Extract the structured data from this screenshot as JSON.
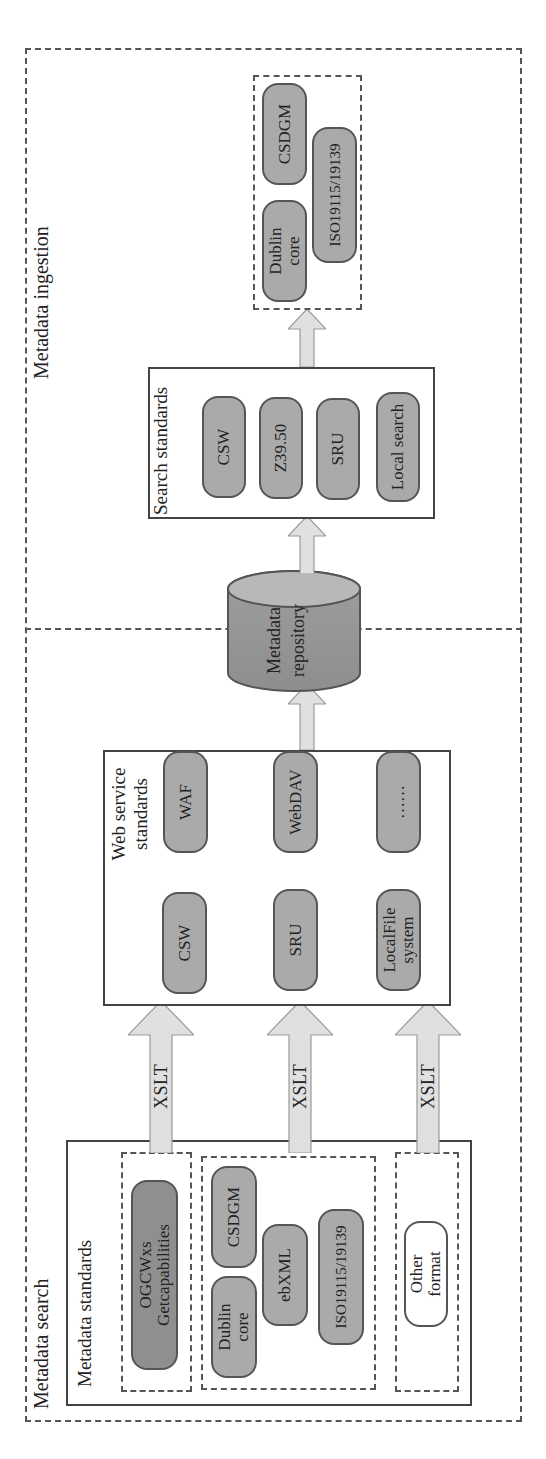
{
  "sections": {
    "ingestion_label": "Metadata ingestion",
    "search_label": "Metadata search"
  },
  "metadata_standards": {
    "title": "Metadata standards",
    "group1": [
      {
        "label": "OGCWxs Getcapabilities"
      }
    ],
    "group2": [
      {
        "label": "Dublin core"
      },
      {
        "label": "CSDGM"
      },
      {
        "label": "ebXML"
      },
      {
        "label": "ISO19115/19139"
      }
    ],
    "group3": [
      {
        "label": "Other format"
      }
    ]
  },
  "arrows": {
    "xslt1": "XSLT",
    "xslt2": "XSLT",
    "xslt3": "XSLT"
  },
  "web_service_standards": {
    "title": "Web service standards",
    "items": [
      {
        "label": "CSW"
      },
      {
        "label": "WAF"
      },
      {
        "label": "SRU"
      },
      {
        "label": "WebDAV"
      },
      {
        "label": "LocalFile system"
      },
      {
        "label": "……"
      }
    ]
  },
  "repository": {
    "label": "Metadata repository"
  },
  "search_standards": {
    "title": "Search standards",
    "items": [
      {
        "label": "CSW"
      },
      {
        "label": "Z39.50"
      },
      {
        "label": "SRU"
      },
      {
        "label": "Local search"
      }
    ]
  },
  "output_formats": {
    "items": [
      {
        "label": "Dublin core"
      },
      {
        "label": "CSDGM"
      },
      {
        "label": "ISO19115/19139"
      }
    ]
  },
  "colors": {
    "pill_fill": "#aaaaaa",
    "pill_dark_fill": "#8f8f8f",
    "arrow_fill": "#e0e0e0",
    "border": "#444444"
  }
}
